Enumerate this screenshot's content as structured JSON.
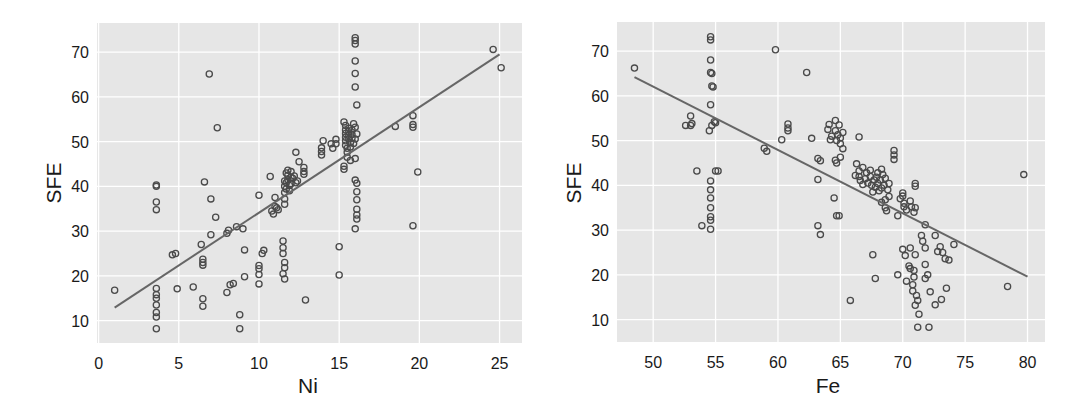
{
  "chart_data": [
    {
      "type": "scatter",
      "title": "",
      "xlabel": "Ni",
      "ylabel": "SFE",
      "xlim": [
        -0.1,
        26.4
      ],
      "ylim": [
        5.0,
        76.5
      ],
      "xticks": [
        0,
        5,
        10,
        15,
        20,
        25
      ],
      "yticks": [
        10,
        20,
        30,
        40,
        50,
        60,
        70
      ],
      "grid": true,
      "legend": null,
      "regression_line": {
        "x": [
          1.0,
          25.0
        ],
        "y": [
          12.9,
          69.5
        ]
      },
      "points": [
        [
          1.0,
          16.8
        ],
        [
          3.6,
          40.3
        ],
        [
          3.6,
          40.0
        ],
        [
          3.6,
          36.5
        ],
        [
          3.6,
          34.8
        ],
        [
          3.6,
          17.2
        ],
        [
          3.6,
          15.8
        ],
        [
          3.6,
          15.0
        ],
        [
          3.6,
          13.5
        ],
        [
          3.6,
          11.8
        ],
        [
          3.6,
          10.8
        ],
        [
          3.6,
          8.2
        ],
        [
          4.6,
          24.7
        ],
        [
          4.8,
          25.0
        ],
        [
          4.9,
          17.1
        ],
        [
          5.9,
          17.5
        ],
        [
          6.4,
          27.0
        ],
        [
          6.5,
          23.7
        ],
        [
          6.5,
          23.0
        ],
        [
          6.5,
          22.4
        ],
        [
          6.5,
          14.9
        ],
        [
          6.5,
          13.2
        ],
        [
          6.6,
          41.0
        ],
        [
          6.9,
          65.1
        ],
        [
          7.0,
          29.2
        ],
        [
          7.0,
          37.2
        ],
        [
          7.3,
          33.1
        ],
        [
          7.4,
          53.1
        ],
        [
          8.0,
          29.5
        ],
        [
          8.0,
          16.3
        ],
        [
          8.1,
          30.2
        ],
        [
          8.2,
          18.0
        ],
        [
          8.4,
          18.3
        ],
        [
          8.6,
          31.0
        ],
        [
          8.8,
          11.3
        ],
        [
          8.8,
          8.2
        ],
        [
          9.0,
          30.5
        ],
        [
          9.1,
          25.8
        ],
        [
          9.1,
          19.8
        ],
        [
          10.0,
          38.0
        ],
        [
          10.0,
          22.3
        ],
        [
          10.0,
          21.6
        ],
        [
          10.0,
          20.3
        ],
        [
          10.0,
          18.2
        ],
        [
          10.2,
          25.0
        ],
        [
          10.3,
          25.7
        ],
        [
          10.7,
          42.2
        ],
        [
          10.8,
          34.5
        ],
        [
          10.9,
          33.8
        ],
        [
          11.0,
          37.5
        ],
        [
          11.0,
          35.5
        ],
        [
          11.1,
          35.2
        ],
        [
          11.2,
          34.8
        ],
        [
          11.6,
          41.2
        ],
        [
          11.6,
          40.0
        ],
        [
          11.6,
          38.6
        ],
        [
          11.6,
          37.2
        ],
        [
          11.6,
          36.0
        ],
        [
          11.7,
          40.8
        ],
        [
          11.7,
          39.4
        ],
        [
          11.8,
          42.5
        ],
        [
          11.8,
          41.5
        ],
        [
          11.9,
          40.2
        ],
        [
          11.9,
          39.0
        ],
        [
          12.0,
          42.0
        ],
        [
          12.0,
          40.6
        ],
        [
          12.1,
          41.8
        ],
        [
          12.2,
          42.3
        ],
        [
          12.3,
          40.8
        ],
        [
          12.4,
          41.2
        ],
        [
          11.7,
          43.0
        ],
        [
          11.8,
          43.6
        ],
        [
          12.0,
          43.3
        ],
        [
          11.5,
          27.8
        ],
        [
          11.5,
          26.3
        ],
        [
          11.5,
          25.0
        ],
        [
          11.6,
          23.0
        ],
        [
          11.6,
          21.8
        ],
        [
          11.5,
          20.5
        ],
        [
          11.6,
          19.3
        ],
        [
          12.3,
          47.6
        ],
        [
          12.5,
          45.5
        ],
        [
          12.8,
          43.3
        ],
        [
          12.8,
          42.7
        ],
        [
          12.8,
          44.2
        ],
        [
          12.9,
          14.6
        ],
        [
          13.9,
          47.8
        ],
        [
          13.9,
          47.0
        ],
        [
          13.9,
          48.6
        ],
        [
          14.0,
          50.2
        ],
        [
          14.5,
          49.5
        ],
        [
          14.6,
          48.5
        ],
        [
          14.8,
          49.5
        ],
        [
          14.8,
          50.5
        ],
        [
          15.0,
          26.5
        ],
        [
          15.0,
          20.2
        ],
        [
          15.3,
          54.4
        ],
        [
          15.4,
          53.6
        ],
        [
          15.4,
          52.6
        ],
        [
          15.4,
          51.8
        ],
        [
          15.4,
          51.0
        ],
        [
          15.4,
          50.2
        ],
        [
          15.4,
          49.2
        ],
        [
          15.5,
          48.5
        ],
        [
          15.5,
          47.6
        ],
        [
          15.6,
          53.0
        ],
        [
          15.6,
          52.2
        ],
        [
          15.6,
          51.4
        ],
        [
          15.6,
          50.6
        ],
        [
          15.7,
          49.8
        ],
        [
          15.7,
          48.8
        ],
        [
          15.8,
          52.6
        ],
        [
          15.8,
          51.6
        ],
        [
          15.8,
          50.8
        ],
        [
          15.9,
          54.0
        ],
        [
          15.9,
          49.6
        ],
        [
          15.3,
          44.5
        ],
        [
          15.3,
          43.8
        ],
        [
          15.5,
          46.5
        ],
        [
          15.7,
          45.8
        ],
        [
          16.0,
          73.2
        ],
        [
          16.0,
          72.6
        ],
        [
          16.0,
          71.8
        ],
        [
          16.0,
          68.0
        ],
        [
          16.0,
          65.2
        ],
        [
          16.0,
          62.2
        ],
        [
          16.1,
          58.2
        ],
        [
          16.0,
          53.2
        ],
        [
          16.1,
          51.7
        ],
        [
          16.0,
          50.6
        ],
        [
          16.0,
          46.2
        ],
        [
          16.0,
          41.4
        ],
        [
          16.1,
          40.7
        ],
        [
          16.1,
          38.8
        ],
        [
          16.1,
          37.0
        ],
        [
          16.1,
          34.9
        ],
        [
          16.1,
          33.6
        ],
        [
          16.1,
          32.7
        ],
        [
          16.0,
          30.5
        ],
        [
          18.5,
          53.4
        ],
        [
          19.6,
          55.8
        ],
        [
          19.6,
          53.8
        ],
        [
          19.6,
          53.2
        ],
        [
          19.6,
          31.2
        ],
        [
          19.9,
          43.2
        ],
        [
          24.6,
          70.6
        ],
        [
          25.1,
          66.5
        ]
      ]
    },
    {
      "type": "scatter",
      "title": "",
      "xlabel": "Fe",
      "ylabel": "SFE",
      "xlim": [
        47.1,
        81.4
      ],
      "ylim": [
        5.0,
        76.5
      ],
      "xticks": [
        50,
        55,
        60,
        65,
        70,
        75,
        80
      ],
      "yticks": [
        10,
        20,
        30,
        40,
        50,
        60,
        70
      ],
      "grid": true,
      "legend": null,
      "regression_line": {
        "x": [
          48.5,
          80.0
        ],
        "y": [
          64.2,
          19.6
        ]
      },
      "points": [
        [
          48.5,
          66.2
        ],
        [
          52.6,
          53.4
        ],
        [
          53.0,
          55.5
        ],
        [
          53.0,
          53.4
        ],
        [
          53.1,
          53.8
        ],
        [
          53.5,
          43.2
        ],
        [
          53.9,
          31.0
        ],
        [
          54.6,
          73.2
        ],
        [
          54.6,
          72.5
        ],
        [
          54.6,
          68.0
        ],
        [
          54.6,
          65.2
        ],
        [
          54.7,
          65.0
        ],
        [
          54.7,
          62.2
        ],
        [
          54.8,
          62.0
        ],
        [
          54.6,
          58.0
        ],
        [
          54.5,
          52.2
        ],
        [
          54.7,
          53.4
        ],
        [
          54.9,
          54.2
        ],
        [
          55.0,
          54.0
        ],
        [
          54.6,
          41.0
        ],
        [
          54.6,
          39.0
        ],
        [
          54.6,
          37.2
        ],
        [
          54.6,
          35.0
        ],
        [
          54.6,
          33.0
        ],
        [
          54.6,
          32.2
        ],
        [
          54.6,
          30.2
        ],
        [
          55.0,
          43.2
        ],
        [
          55.2,
          43.2
        ],
        [
          58.9,
          48.3
        ],
        [
          59.1,
          47.6
        ],
        [
          59.8,
          70.3
        ],
        [
          60.3,
          50.2
        ],
        [
          60.8,
          53.7
        ],
        [
          60.8,
          52.8
        ],
        [
          60.8,
          52.2
        ],
        [
          62.3,
          65.2
        ],
        [
          62.7,
          50.5
        ],
        [
          63.2,
          46.0
        ],
        [
          63.4,
          45.5
        ],
        [
          63.2,
          41.3
        ],
        [
          63.2,
          31.0
        ],
        [
          63.4,
          29.0
        ],
        [
          64.0,
          52.5
        ],
        [
          64.1,
          53.6
        ],
        [
          64.3,
          51.0
        ],
        [
          64.2,
          50.2
        ],
        [
          64.6,
          54.5
        ],
        [
          64.9,
          53.5
        ],
        [
          64.6,
          52.2
        ],
        [
          64.8,
          51.3
        ],
        [
          65.0,
          50.6
        ],
        [
          65.2,
          51.8
        ],
        [
          64.7,
          50.0
        ],
        [
          65.2,
          48.2
        ],
        [
          65.0,
          49.3
        ],
        [
          64.6,
          45.6
        ],
        [
          64.7,
          45.0
        ],
        [
          64.5,
          37.2
        ],
        [
          64.7,
          33.2
        ],
        [
          64.9,
          33.2
        ],
        [
          65.0,
          46.3
        ],
        [
          65.8,
          14.3
        ],
        [
          66.2,
          42.2
        ],
        [
          66.5,
          50.8
        ],
        [
          66.3,
          44.8
        ],
        [
          66.8,
          44.0
        ],
        [
          66.5,
          43.2
        ],
        [
          67.1,
          42.8
        ],
        [
          66.5,
          42.0
        ],
        [
          66.6,
          41.1
        ],
        [
          66.8,
          40.2
        ],
        [
          67.0,
          41.5
        ],
        [
          67.2,
          40.5
        ],
        [
          67.4,
          42.0
        ],
        [
          67.5,
          40.0
        ],
        [
          67.7,
          41.2
        ],
        [
          67.8,
          39.6
        ],
        [
          67.9,
          41.8
        ],
        [
          68.0,
          40.4
        ],
        [
          68.2,
          41.2
        ],
        [
          68.3,
          39.4
        ],
        [
          68.4,
          42.4
        ],
        [
          68.5,
          40.0
        ],
        [
          68.6,
          41.6
        ],
        [
          68.1,
          38.8
        ],
        [
          67.6,
          38.5
        ],
        [
          68.8,
          39.0
        ],
        [
          68.9,
          40.4
        ],
        [
          67.4,
          43.4
        ],
        [
          68.0,
          42.8
        ],
        [
          68.3,
          43.6
        ],
        [
          67.6,
          24.5
        ],
        [
          67.8,
          19.2
        ],
        [
          68.3,
          36.2
        ],
        [
          68.6,
          35.0
        ],
        [
          68.7,
          34.3
        ],
        [
          68.6,
          36.8
        ],
        [
          68.9,
          37.5
        ],
        [
          69.3,
          47.8
        ],
        [
          69.3,
          46.8
        ],
        [
          69.3,
          45.8
        ],
        [
          69.6,
          33.2
        ],
        [
          69.8,
          37.0
        ],
        [
          70.0,
          38.3
        ],
        [
          70.0,
          37.6
        ],
        [
          70.1,
          36.0
        ],
        [
          70.1,
          35.2
        ],
        [
          70.3,
          34.5
        ],
        [
          70.6,
          36.5
        ],
        [
          70.7,
          35.2
        ],
        [
          71.0,
          35.0
        ],
        [
          71.0,
          40.4
        ],
        [
          71.0,
          39.8
        ],
        [
          70.9,
          34.0
        ],
        [
          69.6,
          20.0
        ],
        [
          70.0,
          25.7
        ],
        [
          70.2,
          24.3
        ],
        [
          70.6,
          26.0
        ],
        [
          71.0,
          24.5
        ],
        [
          70.9,
          19.5
        ],
        [
          70.8,
          17.8
        ],
        [
          70.8,
          16.4
        ],
        [
          71.2,
          14.3
        ],
        [
          71.0,
          13.2
        ],
        [
          70.5,
          22.0
        ],
        [
          70.6,
          21.4
        ],
        [
          70.3,
          18.6
        ],
        [
          70.9,
          21.0
        ],
        [
          71.1,
          15.4
        ],
        [
          71.3,
          11.2
        ],
        [
          71.2,
          8.3
        ],
        [
          71.5,
          28.8
        ],
        [
          71.8,
          31.2
        ],
        [
          71.8,
          26.0
        ],
        [
          71.8,
          22.3
        ],
        [
          71.8,
          19.2
        ],
        [
          72.0,
          20.0
        ],
        [
          71.6,
          27.5
        ],
        [
          72.1,
          8.3
        ],
        [
          72.2,
          16.2
        ],
        [
          72.6,
          13.3
        ],
        [
          72.6,
          28.8
        ],
        [
          72.8,
          25.2
        ],
        [
          73.0,
          26.3
        ],
        [
          73.2,
          25.0
        ],
        [
          73.1,
          14.5
        ],
        [
          73.5,
          17.0
        ],
        [
          74.1,
          26.8
        ],
        [
          73.4,
          23.6
        ],
        [
          73.7,
          23.3
        ],
        [
          78.4,
          17.4
        ],
        [
          79.7,
          42.4
        ]
      ]
    }
  ],
  "charts": [
    {
      "xlabel": "Ni",
      "ylabel": "SFE"
    },
    {
      "xlabel": "Fe",
      "ylabel": "SFE"
    }
  ],
  "style": {
    "panel_bg": "#e6e6e6",
    "grid_color": "#ffffff",
    "marker_stroke": "#4a4a4a",
    "line_color": "#666666"
  }
}
